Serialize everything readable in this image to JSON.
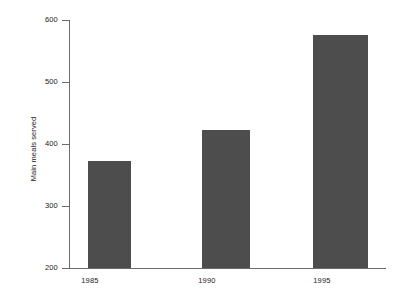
{
  "chart_data": {
    "type": "bar",
    "title": "",
    "subtitle": "",
    "xlabel": "",
    "ylabel": "Main meals served",
    "categories": [
      "1985",
      "1990",
      "1995"
    ],
    "values": [
      372,
      423,
      576
    ],
    "series": [
      {
        "name": "Main meals served",
        "values": [
          372,
          423,
          576
        ]
      }
    ],
    "ylim": [
      200,
      600
    ],
    "yticks": [
      200,
      300,
      400,
      500,
      600
    ],
    "ytick_labels": [
      "200",
      "300",
      "400",
      "500",
      "600"
    ],
    "grid": false,
    "legend": false,
    "legend_position": "none",
    "bar_color": "#4d4d4d",
    "axis_color": "#6b6b6b",
    "background_color": "#ffffff",
    "text_color": "#1a1a1a",
    "annotations": []
  }
}
